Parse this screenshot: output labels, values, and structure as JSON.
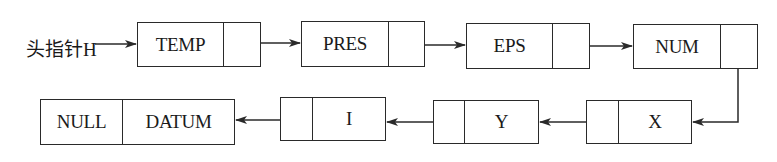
{
  "diagram": {
    "type": "linked-list",
    "head_label": "头指针H",
    "nodes": [
      {
        "id": "temp",
        "data": "TEMP",
        "pointer": ""
      },
      {
        "id": "pres",
        "data": "PRES",
        "pointer": ""
      },
      {
        "id": "eps",
        "data": "EPS",
        "pointer": ""
      },
      {
        "id": "num",
        "data": "NUM",
        "pointer": ""
      },
      {
        "id": "x",
        "data": "X",
        "pointer": ""
      },
      {
        "id": "y",
        "data": "Y",
        "pointer": ""
      },
      {
        "id": "i",
        "data": "I",
        "pointer": ""
      },
      {
        "id": "last",
        "pointer_value": "NULL",
        "data": "DATUM"
      }
    ],
    "edges": [
      [
        "head",
        "temp"
      ],
      [
        "temp",
        "pres"
      ],
      [
        "pres",
        "eps"
      ],
      [
        "eps",
        "num"
      ],
      [
        "num",
        "x"
      ],
      [
        "x",
        "y"
      ],
      [
        "y",
        "i"
      ],
      [
        "i",
        "last"
      ]
    ],
    "line_color": "#2a2a2a"
  }
}
